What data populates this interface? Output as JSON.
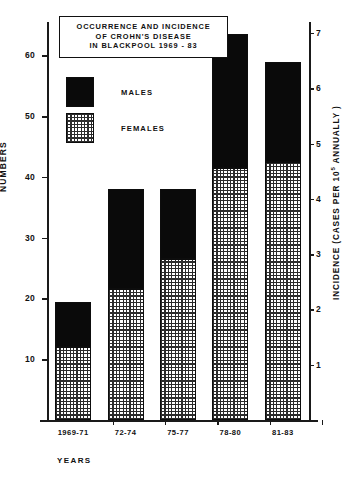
{
  "title_lines": [
    "OCCURRENCE  AND  INCIDENCE",
    "OF  CROHN'S  DISEASE",
    "IN BLACKPOOL  1969 - 83"
  ],
  "legend": {
    "males_label": "MALES",
    "females_label": "FEMALES"
  },
  "axes": {
    "left_title": "NUMBERS",
    "right_title_pre": "INCIDENCE  (CASES  PER  10",
    "right_title_sup": "5",
    "right_title_post": " ANNUALLY )",
    "x_title": "YEARS"
  },
  "colors": {
    "males": "#0a0a0a",
    "females": "#ffffff",
    "axis": "#1a1a1a",
    "background": "#ffffff"
  },
  "chart_data": {
    "type": "bar",
    "stacked": true,
    "title": "OCCURRENCE AND INCIDENCE OF CROHN'S DISEASE IN BLACKPOOL 1969 - 83",
    "categories": [
      "1969-71",
      "72-74",
      "75-77",
      "78-80",
      "81-83"
    ],
    "series": [
      {
        "name": "FEMALES",
        "values": [
          12,
          21.5,
          26.5,
          41.5,
          42.5
        ]
      },
      {
        "name": "MALES",
        "values": [
          7.5,
          16.5,
          11.5,
          22,
          16.5
        ]
      }
    ],
    "totals": [
      19.5,
      38,
      38,
      63.5,
      59
    ],
    "xlabel": "YEARS",
    "ylabel": "NUMBERS",
    "ylim": [
      0,
      65.5
    ],
    "yticks": [
      10,
      20,
      30,
      40,
      50,
      60
    ],
    "y2label": "INCIDENCE (CASES PER 10^5 ANNUALLY)",
    "y2lim": [
      0,
      7.2
    ],
    "y2ticks": [
      1,
      2,
      3,
      4,
      5,
      6,
      7
    ],
    "grid": false,
    "legend_position": "upper-left-inside"
  }
}
